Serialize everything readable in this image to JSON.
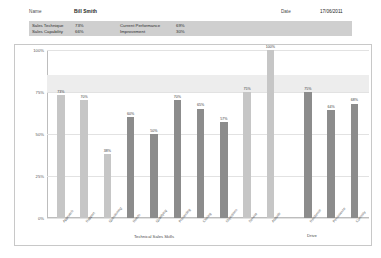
{
  "header": {
    "name_label": "Name",
    "name_value": "Bill Smith",
    "date_label": "Date",
    "date_value": "17/06/2011",
    "summary": [
      {
        "label": "Sales Technique",
        "value": "73%"
      },
      {
        "label": "Sales Capability",
        "value": "66%"
      },
      {
        "label": "Current Performance",
        "value": "69%"
      },
      {
        "label": "Improvement",
        "value": "30%"
      }
    ]
  },
  "chart_data": {
    "type": "bar",
    "title": "",
    "xlabel": "Technical Sales Skills",
    "xlabel_secondary": "Drive",
    "ylabel": "",
    "ylim": [
      0,
      100
    ],
    "yticks": [
      "0%",
      "25%",
      "50%",
      "75%",
      "100%"
    ],
    "ytick_values": [
      0,
      25,
      50,
      75,
      100
    ],
    "grid": true,
    "legend": "none",
    "band": {
      "from": 75,
      "to": 85,
      "color": "#ededed"
    },
    "colors": {
      "light": "#c6c6c6",
      "dark": "#8c8c8c"
    },
    "categories": [
      "Approach",
      "Rapport",
      "Questioning",
      "Needs",
      "Qualifying",
      "Presenting",
      "Closing",
      "Objections",
      "Service",
      "Attitude",
      "Resilience",
      "Persistence",
      "Curiosity"
    ],
    "values": [
      73,
      70,
      38,
      60,
      50,
      70,
      65,
      57,
      75,
      100,
      75,
      64,
      68
    ],
    "labels": [
      "73%",
      "70%",
      "38%",
      "60%",
      "50%",
      "70%",
      "65%",
      "57%",
      "75%",
      "100%",
      "75%",
      "64%",
      "68%"
    ],
    "shades": [
      "light",
      "light",
      "light",
      "dark",
      "dark",
      "dark",
      "dark",
      "dark",
      "light",
      "light",
      "dark",
      "dark",
      "dark"
    ],
    "groups": [
      {
        "name": "Technical Sales Skills",
        "start": 0,
        "end": 9
      },
      {
        "name": "Drive",
        "start": 10,
        "end": 12
      }
    ]
  }
}
